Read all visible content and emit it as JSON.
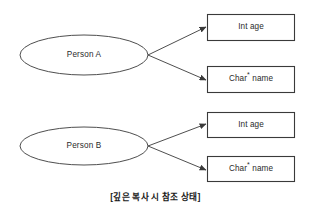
{
  "diagram": {
    "caption": "[깊은 복사 시 참조 상태]",
    "stroke_color": "#3a3a3a",
    "text_color": "#2b2b2b",
    "background_color": "#ffffff",
    "groups": [
      {
        "node_label": "Person A",
        "fields": [
          {
            "type": "Int",
            "name": "age",
            "text": "Int age"
          },
          {
            "type": "Char*",
            "name": "name",
            "text_prefix": "Char",
            "text_suffix": " name"
          }
        ]
      },
      {
        "node_label": "Person B",
        "fields": [
          {
            "type": "Int",
            "name": "age",
            "text": "Int age"
          },
          {
            "type": "Char*",
            "name": "name",
            "text_prefix": "Char",
            "text_suffix": " name"
          }
        ]
      }
    ]
  }
}
